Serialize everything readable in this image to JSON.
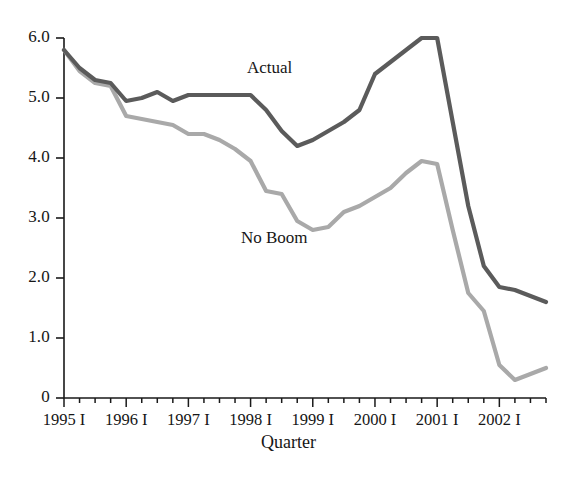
{
  "chart_data": {
    "type": "line",
    "title": "",
    "subtitle": "",
    "xlabel": "Quarter",
    "ylabel": "",
    "grid": false,
    "legend_position": "inline-annotation",
    "ylim": [
      0,
      6.0
    ],
    "ytick_labels": [
      "6.0",
      "5.0",
      "4.0",
      "3.0",
      "2.0",
      "1.0",
      "0"
    ],
    "ytick_values": [
      6.0,
      5.0,
      4.0,
      3.0,
      2.0,
      1.0,
      0
    ],
    "xtick_labels": [
      "1995 I",
      "1996 I",
      "1997 I",
      "1998 I",
      "1999 I",
      "2000 I",
      "2001 I",
      "2002 I"
    ],
    "xtick_values": [
      0,
      4,
      8,
      12,
      16,
      20,
      24,
      28
    ],
    "x_minor_tick_interval": 1,
    "x_range": [
      0,
      31
    ],
    "x_quarters": [
      "1995 I",
      "1995 II",
      "1995 III",
      "1995 IV",
      "1996 I",
      "1996 II",
      "1996 III",
      "1996 IV",
      "1997 I",
      "1997 II",
      "1997 III",
      "1997 IV",
      "1998 I",
      "1998 II",
      "1998 III",
      "1998 IV",
      "1999 I",
      "1999 II",
      "1999 III",
      "1999 IV",
      "2000 I",
      "2000 II",
      "2000 III",
      "2000 IV",
      "2001 I",
      "2001 II",
      "2001 III",
      "2001 IV",
      "2002 I",
      "2002 II",
      "2002 III",
      "2002 IV"
    ],
    "series": [
      {
        "name": "Actual",
        "color": "#5b5b5b",
        "label_position": {
          "x": 247,
          "y": 58
        },
        "values": [
          5.8,
          5.5,
          5.3,
          5.25,
          4.95,
          5.0,
          5.1,
          4.95,
          5.05,
          5.05,
          5.05,
          5.05,
          5.05,
          4.8,
          4.45,
          4.2,
          4.3,
          4.45,
          4.6,
          4.8,
          5.4,
          5.6,
          5.8,
          6.0,
          6.0,
          4.6,
          3.2,
          2.2,
          1.85,
          1.8,
          1.7,
          1.6
        ]
      },
      {
        "name": "No Boom",
        "color": "#a9a9a9",
        "label_position": {
          "x": 241,
          "y": 228
        },
        "values": [
          5.8,
          5.45,
          5.25,
          5.2,
          4.7,
          4.65,
          4.6,
          4.55,
          4.4,
          4.4,
          4.3,
          4.15,
          3.95,
          3.45,
          3.4,
          2.95,
          2.8,
          2.85,
          3.1,
          3.2,
          3.35,
          3.5,
          3.75,
          3.95,
          3.9,
          2.8,
          1.75,
          1.45,
          0.55,
          0.3,
          0.4,
          0.5
        ]
      }
    ],
    "annotations": [
      {
        "text": "Actual",
        "series": "Actual"
      },
      {
        "text": "No Boom",
        "series": "No Boom"
      }
    ],
    "axis": {
      "color": "#1a1a1a",
      "left_px": 64,
      "right_px": 546,
      "top_px": 38,
      "bottom_px": 398,
      "px_per_quarter": 15.55,
      "px_per_unit": 60
    }
  },
  "figure": {
    "background": "#ffffff",
    "x_axis_title": "Quarter"
  }
}
